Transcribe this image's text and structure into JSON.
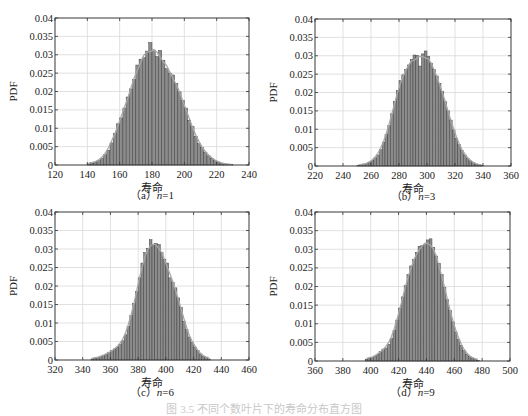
{
  "figure": {
    "caption": "图 3.5  不同个数叶片下的寿命分布直方图",
    "colors": {
      "bar_fill": "#8c8c8c",
      "bar_edge": "#3a3a3a",
      "fit_curve": "#a8a8a8",
      "grid": "#d9d9d9",
      "axis": "#333333"
    }
  },
  "chart_data": [
    {
      "type": "bar",
      "panel": "a",
      "subcaption_prefix": "（a）",
      "subcaption_var": "n",
      "subcaption_value": "=1",
      "title": "",
      "xlabel": "寿命",
      "ylabel": "PDF",
      "xlim": [
        120,
        240
      ],
      "ylim": [
        0,
        0.04
      ],
      "xticks": [
        120,
        140,
        160,
        180,
        200,
        220,
        240
      ],
      "yticks": [
        0,
        0.005,
        0.01,
        0.015,
        0.02,
        0.025,
        0.03,
        0.035,
        0.04
      ],
      "ytick_labels": [
        "0",
        "0.005",
        "0.01",
        "0.015",
        "0.02",
        "0.025",
        "0.03",
        "0.035",
        "0.04"
      ],
      "grid": true,
      "histogram": {
        "bin_start": 140,
        "bin_width": 2,
        "values": [
          0.0003,
          0.0005,
          0.0008,
          0.0012,
          0.0018,
          0.0028,
          0.004,
          0.006,
          0.0085,
          0.0112,
          0.0128,
          0.0155,
          0.0185,
          0.0207,
          0.0232,
          0.0272,
          0.0288,
          0.0292,
          0.031,
          0.0333,
          0.0313,
          0.0295,
          0.0312,
          0.0285,
          0.0262,
          0.025,
          0.0245,
          0.0222,
          0.0199,
          0.0175,
          0.0155,
          0.0122,
          0.0105,
          0.0078,
          0.0058,
          0.0048,
          0.0035,
          0.0025,
          0.0018,
          0.0012,
          0.0008,
          0.0005,
          0.0003,
          0.0002,
          0.0001
        ]
      },
      "fit": {
        "distribution": "normal",
        "mean": 180,
        "std": 12,
        "peak": 0.0333
      }
    },
    {
      "type": "bar",
      "panel": "b",
      "subcaption_prefix": "（b）",
      "subcaption_var": "n",
      "subcaption_value": "=3",
      "title": "",
      "xlabel": "寿命",
      "ylabel": "PDF",
      "xlim": [
        220,
        360
      ],
      "ylim": [
        0,
        0.04
      ],
      "xticks": [
        220,
        240,
        260,
        280,
        300,
        320,
        340,
        360
      ],
      "yticks": [
        0,
        0.005,
        0.01,
        0.015,
        0.02,
        0.025,
        0.03,
        0.035,
        0.04
      ],
      "ytick_labels": [
        "0",
        "0.005",
        "0.01",
        "0.015",
        "0.02",
        "0.025",
        "0.03",
        "0.035",
        "0.04"
      ],
      "grid": true,
      "histogram": {
        "bin_start": 250,
        "bin_width": 2,
        "values": [
          0.0002,
          0.0003,
          0.0005,
          0.0007,
          0.001,
          0.0015,
          0.0022,
          0.003,
          0.0045,
          0.0065,
          0.0085,
          0.011,
          0.0142,
          0.0175,
          0.0205,
          0.0232,
          0.0248,
          0.0262,
          0.0275,
          0.029,
          0.0302,
          0.0301,
          0.0272,
          0.0305,
          0.0313,
          0.0298,
          0.028,
          0.0262,
          0.0245,
          0.0225,
          0.0202,
          0.0175,
          0.015,
          0.0125,
          0.0098,
          0.0075,
          0.0058,
          0.0042,
          0.003,
          0.002,
          0.0014,
          0.0009,
          0.0005,
          0.0003,
          0.0002
        ]
      },
      "fit": {
        "distribution": "normal",
        "mean": 294,
        "std": 13,
        "peak": 0.0308
      }
    },
    {
      "type": "bar",
      "panel": "c",
      "subcaption_prefix": "（c）",
      "subcaption_var": "n",
      "subcaption_value": "=6",
      "title": "",
      "xlabel": "寿命",
      "ylabel": "PDF",
      "xlim": [
        320,
        460
      ],
      "ylim": [
        0,
        0.04
      ],
      "xticks": [
        320,
        340,
        360,
        380,
        400,
        420,
        440,
        460
      ],
      "yticks": [
        0,
        0.005,
        0.01,
        0.015,
        0.02,
        0.025,
        0.03,
        0.035,
        0.04
      ],
      "ytick_labels": [
        "0",
        "0.005",
        "0.01",
        "0.015",
        "0.02",
        "0.025",
        "0.03",
        "0.035",
        "0.04"
      ],
      "grid": true,
      "histogram": {
        "bin_start": 346,
        "bin_width": 2,
        "values": [
          0.0003,
          0.0005,
          0.0007,
          0.001,
          0.0013,
          0.0016,
          0.002,
          0.0025,
          0.003,
          0.0035,
          0.0042,
          0.0052,
          0.0068,
          0.009,
          0.012,
          0.0152,
          0.0185,
          0.0222,
          0.0262,
          0.029,
          0.0302,
          0.0325,
          0.0312,
          0.0315,
          0.0312,
          0.029,
          0.0272,
          0.0262,
          0.0222,
          0.021,
          0.0195,
          0.0168,
          0.0142,
          0.0105,
          0.0082,
          0.0062,
          0.0048,
          0.0035,
          0.0025,
          0.0016,
          0.001,
          0.0006,
          0.0003
        ]
      },
      "fit": {
        "distribution": "skewed (extreme-value-like)",
        "mode": 392,
        "peak": 0.032
      }
    },
    {
      "type": "bar",
      "panel": "d",
      "subcaption_prefix": "（d）",
      "subcaption_var": "n",
      "subcaption_value": "=9",
      "title": "",
      "xlabel": "寿命",
      "ylabel": "PDF",
      "xlim": [
        360,
        500
      ],
      "ylim": [
        0,
        0.04
      ],
      "xticks": [
        360,
        380,
        400,
        420,
        440,
        460,
        480,
        500
      ],
      "yticks": [
        0,
        0.005,
        0.01,
        0.015,
        0.02,
        0.025,
        0.03,
        0.035,
        0.04
      ],
      "ytick_labels": [
        "0",
        "0.005",
        "0.01",
        "0.015",
        "0.02",
        "0.025",
        "0.03",
        "0.035",
        "0.04"
      ],
      "grid": true,
      "histogram": {
        "bin_start": 396,
        "bin_width": 2,
        "values": [
          0.0005,
          0.0007,
          0.001,
          0.0013,
          0.0018,
          0.0025,
          0.0032,
          0.0035,
          0.0045,
          0.006,
          0.0082,
          0.011,
          0.0142,
          0.0172,
          0.0202,
          0.0232,
          0.0255,
          0.0272,
          0.0292,
          0.0308,
          0.031,
          0.0312,
          0.0325,
          0.0328,
          0.0305,
          0.0282,
          0.0262,
          0.0232,
          0.0198,
          0.0165,
          0.0135,
          0.0105,
          0.0078,
          0.0058,
          0.0042,
          0.0028,
          0.0018,
          0.0012,
          0.0008,
          0.0004,
          0.0002
        ]
      },
      "fit": {
        "distribution": "skewed (extreme-value-like)",
        "mode": 442,
        "peak": 0.0322
      }
    }
  ]
}
